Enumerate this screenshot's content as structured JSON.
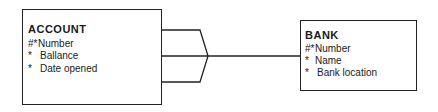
{
  "diagram": {
    "type": "entity-relationship",
    "entities": [
      {
        "name": "ACCOUNT",
        "attributes": [
          {
            "marker": "#*",
            "label": "Number"
          },
          {
            "marker": "*",
            "label": "Ballance"
          },
          {
            "marker": "*",
            "label": "Date opened"
          }
        ]
      },
      {
        "name": "BANK",
        "attributes": [
          {
            "marker": "#*",
            "label": "Number"
          },
          {
            "marker": "*",
            "label": "Name"
          },
          {
            "marker": "*",
            "label": "Bank location"
          }
        ]
      }
    ],
    "relationship": {
      "from": "ACCOUNT",
      "to": "BANK",
      "from_cardinality": "many",
      "to_cardinality": "one",
      "notation": "crow's foot"
    },
    "colors": {
      "line": "#222222",
      "background": "#ffffff",
      "text": "#1a1a1a"
    }
  }
}
